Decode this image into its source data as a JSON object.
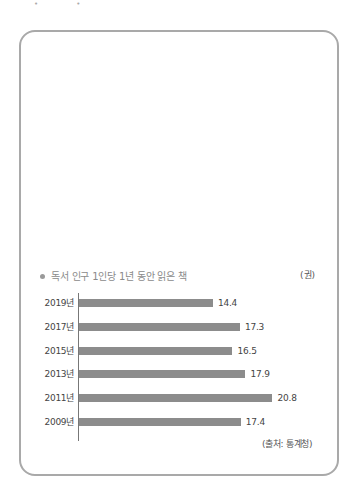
{
  "header": {
    "marks": "• •"
  },
  "chart_data": {
    "type": "bar",
    "orientation": "horizontal",
    "title": "독서 인구 1인당 1년 동안 읽은 책",
    "unit": "(권)",
    "categories": [
      "2019년",
      "2017년",
      "2015년",
      "2013년",
      "2011년",
      "2009년"
    ],
    "values": [
      14.4,
      17.3,
      16.5,
      17.9,
      20.8,
      17.4
    ],
    "value_labels": [
      "14.4",
      "17.3",
      "16.5",
      "17.9",
      "20.8",
      "17.4"
    ],
    "xlabel": "",
    "ylabel": "",
    "grid": false,
    "legend": null,
    "bar_color": "#8c8c8c",
    "source": "(출처: 통계청)"
  }
}
